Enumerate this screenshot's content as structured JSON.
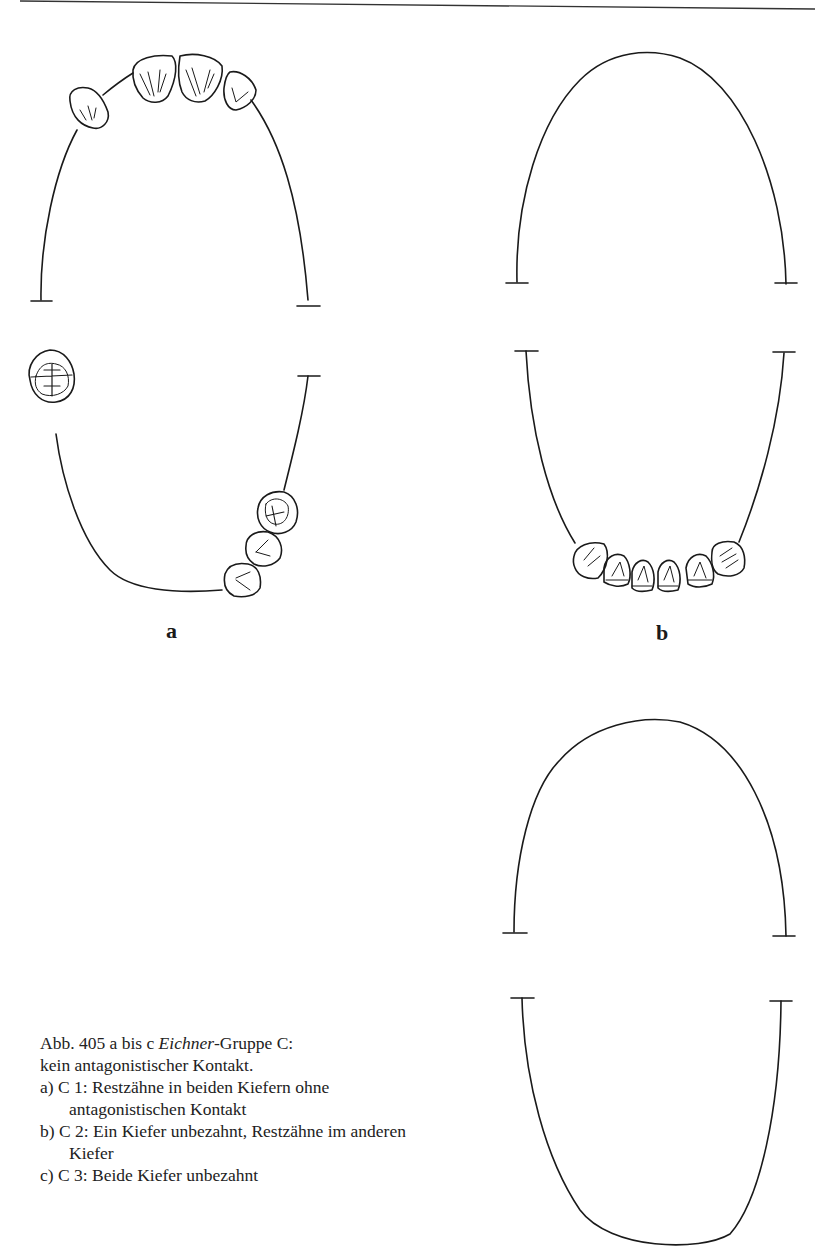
{
  "page": {
    "header_rule": true
  },
  "figure": {
    "panels": [
      {
        "id": "a",
        "label": "a",
        "upper_jaw_teeth": 4,
        "lower_jaw_teeth": 4,
        "description": "Restzähne in beiden Kiefern ohne antagonistischen Kontakt"
      },
      {
        "id": "b",
        "label": "b",
        "upper_jaw_teeth": 0,
        "lower_jaw_teeth": 6,
        "description": "Ein Kiefer unbezahnt, Restzähne im anderen Kiefer"
      },
      {
        "id": "c",
        "label": "",
        "upper_jaw_teeth": 0,
        "lower_jaw_teeth": 0,
        "description": "Beide Kiefer unbezahnt"
      }
    ]
  },
  "caption": {
    "title_prefix": "Abb. 405 a bis c ",
    "title_italic": "Eichner",
    "title_suffix": "-Gruppe C:",
    "subtitle": "kein antagonistischer Kontakt.",
    "items": [
      {
        "marker": "a)",
        "text": "C 1:  Restzähne in beiden Kiefern ohne antagonistischen Kontakt"
      },
      {
        "marker": "b)",
        "text": "C 2:  Ein Kiefer unbezahnt, Restzähne im anderen Kiefer"
      },
      {
        "marker": "c)",
        "text": "C 3:  Beide Kiefer unbezahnt"
      }
    ]
  }
}
